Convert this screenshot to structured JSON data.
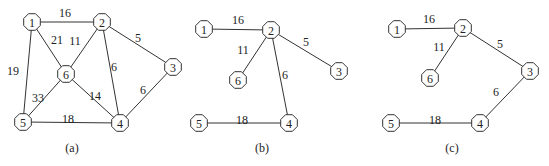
{
  "panels": [
    {
      "id": "a",
      "caption": "(a)",
      "caption_pos": [
        72,
        148
      ],
      "nodes": [
        {
          "id": "1",
          "x": 32,
          "y": 22
        },
        {
          "id": "2",
          "x": 102,
          "y": 22
        },
        {
          "id": "3",
          "x": 173,
          "y": 67
        },
        {
          "id": "4",
          "x": 120,
          "y": 123
        },
        {
          "id": "5",
          "x": 23,
          "y": 122
        },
        {
          "id": "6",
          "x": 66,
          "y": 74
        }
      ],
      "edges": [
        {
          "from": "1",
          "to": "2",
          "weight": "16",
          "lx": 65,
          "ly": 13
        },
        {
          "from": "1",
          "to": "6",
          "weight": "21",
          "lx": 57,
          "ly": 40
        },
        {
          "from": "2",
          "to": "6",
          "weight": "11",
          "lx": 75,
          "ly": 41
        },
        {
          "from": "2",
          "to": "3",
          "weight": "5",
          "lx": 138,
          "ly": 38
        },
        {
          "from": "2",
          "to": "4",
          "weight": "6",
          "lx": 114,
          "ly": 67
        },
        {
          "from": "1",
          "to": "5",
          "weight": "19",
          "lx": 13,
          "ly": 71
        },
        {
          "from": "6",
          "to": "5",
          "weight": "33",
          "lx": 38,
          "ly": 98
        },
        {
          "from": "6",
          "to": "4",
          "weight": "14",
          "lx": 95,
          "ly": 96
        },
        {
          "from": "3",
          "to": "4",
          "weight": "6",
          "lx": 143,
          "ly": 90
        },
        {
          "from": "5",
          "to": "4",
          "weight": "18",
          "lx": 68,
          "ly": 119
        }
      ]
    },
    {
      "id": "b",
      "caption": "(b)",
      "caption_pos": [
        262,
        148
      ],
      "nodes": [
        {
          "id": "1",
          "x": 204,
          "y": 29
        },
        {
          "id": "2",
          "x": 271,
          "y": 30
        },
        {
          "id": "3",
          "x": 339,
          "y": 71
        },
        {
          "id": "4",
          "x": 289,
          "y": 123
        },
        {
          "id": "5",
          "x": 199,
          "y": 123
        },
        {
          "id": "6",
          "x": 238,
          "y": 80
        }
      ],
      "edges": [
        {
          "from": "1",
          "to": "2",
          "weight": "16",
          "lx": 238,
          "ly": 20
        },
        {
          "from": "2",
          "to": "6",
          "weight": "11",
          "lx": 243,
          "ly": 50
        },
        {
          "from": "2",
          "to": "3",
          "weight": "5",
          "lx": 306,
          "ly": 42
        },
        {
          "from": "2",
          "to": "4",
          "weight": "6",
          "lx": 285,
          "ly": 75
        },
        {
          "from": "5",
          "to": "4",
          "weight": "18",
          "lx": 242,
          "ly": 120
        }
      ]
    },
    {
      "id": "c",
      "caption": "(c)",
      "caption_pos": [
        452,
        148
      ],
      "nodes": [
        {
          "id": "1",
          "x": 397,
          "y": 29
        },
        {
          "id": "2",
          "x": 463,
          "y": 28
        },
        {
          "id": "3",
          "x": 530,
          "y": 71
        },
        {
          "id": "4",
          "x": 480,
          "y": 123
        },
        {
          "id": "5",
          "x": 391,
          "y": 123
        },
        {
          "id": "6",
          "x": 430,
          "y": 78
        }
      ],
      "edges": [
        {
          "from": "1",
          "to": "2",
          "weight": "16",
          "lx": 429,
          "ly": 19
        },
        {
          "from": "2",
          "to": "6",
          "weight": "11",
          "lx": 439,
          "ly": 47
        },
        {
          "from": "2",
          "to": "3",
          "weight": "5",
          "lx": 500,
          "ly": 44
        },
        {
          "from": "3",
          "to": "4",
          "weight": "6",
          "lx": 496,
          "ly": 92
        },
        {
          "from": "5",
          "to": "4",
          "weight": "18",
          "lx": 435,
          "ly": 120
        }
      ]
    }
  ],
  "style": {
    "node_radius": 9,
    "stroke_color": "#333333"
  }
}
